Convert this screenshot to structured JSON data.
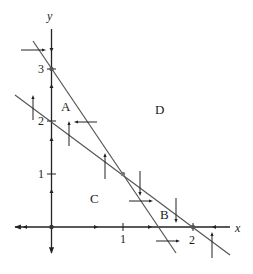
{
  "figure": {
    "type": "phase-portrait",
    "axes": {
      "x_label": "x",
      "y_label": "y",
      "x_ticks": [
        {
          "value": 1,
          "label": "1"
        },
        {
          "value": 2,
          "label": "2"
        }
      ],
      "y_ticks": [
        {
          "value": 1,
          "label": "1"
        },
        {
          "value": 2,
          "label": "2"
        },
        {
          "value": 3,
          "label": "3"
        }
      ]
    },
    "lines": [
      {
        "name": "steep-nullcline",
        "equation": "2x + y = 3",
        "through": [
          [
            0,
            3
          ],
          [
            1,
            1
          ],
          [
            1.5,
            0
          ]
        ]
      },
      {
        "name": "shallow-nullcline",
        "equation": "x + y = 2",
        "through": [
          [
            0,
            2
          ],
          [
            1,
            1
          ],
          [
            2,
            0
          ]
        ]
      }
    ],
    "equilibria": [
      [
        0,
        0
      ],
      [
        0,
        3
      ],
      [
        1,
        1
      ],
      [
        2,
        0
      ]
    ],
    "regions": [
      {
        "label": "A"
      },
      {
        "label": "B"
      },
      {
        "label": "C"
      },
      {
        "label": "D"
      }
    ],
    "colors": {
      "axis": "#222222",
      "line": "#555555",
      "arrow": "#222222",
      "equilibrium": "#666666"
    }
  }
}
